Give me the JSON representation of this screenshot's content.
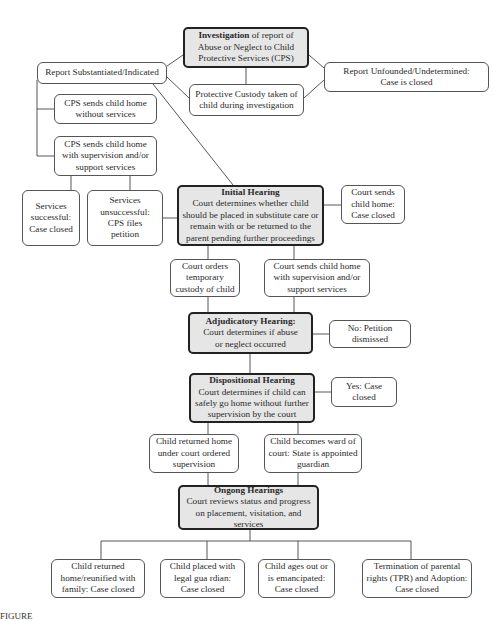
{
  "nodes": {
    "investigation": {
      "title": "Investigation",
      "text": " of report of Abuse or Neglect to Child Protective Services (CPS)"
    },
    "substantiated": {
      "text": "Report Substantiated/Indicated"
    },
    "protective_custody": {
      "text": "Protective Custody taken of child during investigation"
    },
    "unfounded": {
      "text": "Report Unfounded/Undetermined: Case is closed"
    },
    "cps_without_services": {
      "text": "CPS sends child home without services"
    },
    "cps_with_supervision": {
      "text": "CPS sends child home with supervision and/or support services"
    },
    "services_successful": {
      "text": "Services successful: Case closed"
    },
    "services_unsuccessful": {
      "text": "Services unsuccessful: CPS files petition"
    },
    "initial_hearing": {
      "title": "Initial Hearing",
      "text": "Court determines whether child should be placed in substitute care or remain with or be returned to the parent  pending further  proceedings"
    },
    "court_sends_home_closed": {
      "text": "Court sends child home: Case closed"
    },
    "court_temp_custody": {
      "text": "Court orders temporary custody of child"
    },
    "court_home_supervision": {
      "text": "Court sends child home with supervision and/or support services"
    },
    "adjudicatory_hearing": {
      "title": "Adjudicatory Hearing:",
      "text": "Court determines if abuse or neglect occurred"
    },
    "petition_dismissed": {
      "text": "No: Petition dismissed"
    },
    "dispositional_hearing": {
      "title": "Dispositional Hearing",
      "text": "Court determines if child can safely go home without further supervision by the court"
    },
    "yes_case_closed": {
      "text": "Yes: Case closed"
    },
    "child_returned_supervision": {
      "text": "Child returned home under court ordered supervision"
    },
    "child_ward_of_court": {
      "text": "Child becomes ward of court:  State is appointed guardian"
    },
    "ongoing_hearings": {
      "title": "Ongong Hearings",
      "text": "Court reviews status and progress on placement, visitation, and services"
    },
    "reunified": {
      "text": "Child returned home/reunified with family: Case closed"
    },
    "legal_guardian": {
      "text": "Child placed with legal gua rdian: Case closed"
    },
    "emancipated": {
      "text": "Child ages out or is emancipated: Case closed"
    },
    "tpr_adoption": {
      "text": "Termination of parental rights (TPR) and Adoption: Case closed"
    }
  },
  "caption": "FIGURE"
}
